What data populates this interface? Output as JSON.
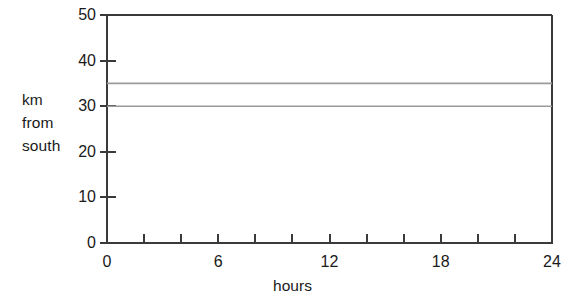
{
  "chart_data": {
    "type": "line",
    "title": "",
    "xlabel": "hours",
    "ylabel": "km from south",
    "ylabel_lines": [
      "km",
      "from",
      "south"
    ],
    "xlim": [
      0,
      24
    ],
    "ylim": [
      0,
      50
    ],
    "grid": false,
    "legend": null,
    "x_ticks_major": [
      0,
      6,
      12,
      18,
      24
    ],
    "x_tick_labels": [
      "0",
      "6",
      "12",
      "18",
      "24"
    ],
    "x_ticks_minor": [
      0,
      2,
      4,
      6,
      8,
      10,
      12,
      14,
      16,
      18,
      20,
      22,
      24
    ],
    "y_ticks": [
      0,
      10,
      20,
      30,
      40,
      50
    ],
    "y_tick_labels": [
      "0",
      "10",
      "20",
      "30",
      "40",
      "50"
    ],
    "series": [
      {
        "name": "upper",
        "color": "#9a9a9a",
        "x": [
          0,
          24
        ],
        "values": [
          35,
          35
        ]
      },
      {
        "name": "lower",
        "color": "#9a9a9a",
        "x": [
          0,
          24
        ],
        "values": [
          30,
          30
        ]
      }
    ],
    "axis_color": "#3a3a3a",
    "frame": [
      "left",
      "bottom",
      "top",
      "right"
    ]
  }
}
